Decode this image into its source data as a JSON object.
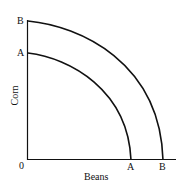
{
  "diagram": {
    "title": "",
    "x_axis_label": "Beans",
    "y_axis_label": "Corn",
    "origin_label": "0",
    "curves": [
      {
        "name": "A",
        "y_intercept_label": "A",
        "x_intercept_label": "A"
      },
      {
        "name": "B",
        "y_intercept_label": "B",
        "x_intercept_label": "B"
      }
    ]
  }
}
